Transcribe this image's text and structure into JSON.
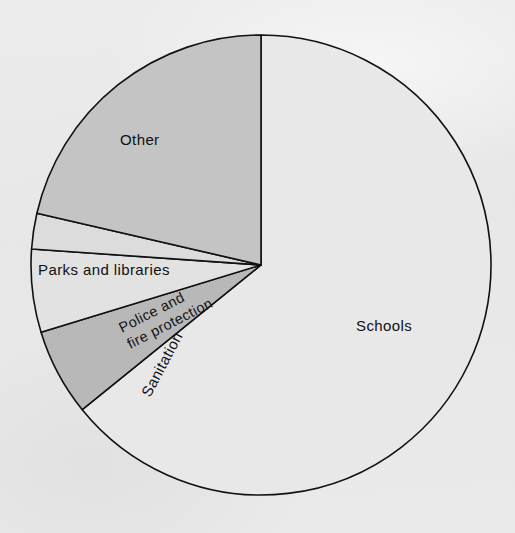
{
  "figure": {
    "background_color": "#e9e9e9",
    "outline_color": "#111111"
  },
  "chart_data": {
    "type": "pie",
    "title": "",
    "subtitle": "",
    "xlabel": "",
    "ylabel": "",
    "legend_position": "none",
    "grid": false,
    "labels_placement": "inside-slice",
    "start_angle_deg": 0,
    "direction": "clockwise",
    "categories": [
      "Schools",
      "Sanitation",
      "Police and fire protection",
      "Parks and libraries",
      "Other"
    ],
    "values": [
      64.2,
      6.1,
      5.8,
      2.5,
      21.4
    ],
    "units": "percent",
    "slices": [
      {
        "label": "Schools",
        "label_line_1": "Schools",
        "label_line_2": "",
        "value": 64.2,
        "start_angle_deg": 0,
        "end_angle_deg": 231,
        "color": "#e8e8e8",
        "label_rotation_deg": 0,
        "label_x": 356,
        "label_y": 331
      },
      {
        "label": "Sanitation",
        "label_line_1": "Sanitation",
        "label_line_2": "",
        "value": 6.1,
        "start_angle_deg": 231,
        "end_angle_deg": 253,
        "color": "#b8b8b8",
        "label_rotation_deg": -62,
        "label_x": 150,
        "label_y": 398
      },
      {
        "label": "Police and fire protection",
        "label_line_1": "Police and",
        "label_line_2": "fire protection",
        "value": 5.8,
        "start_angle_deg": 253,
        "end_angle_deg": 274,
        "color": "#e2e2e2",
        "label_rotation_deg": -27,
        "label_x": 122,
        "label_y": 333
      },
      {
        "label": "Parks and libraries",
        "label_line_1": "Parks and libraries",
        "label_line_2": "",
        "value": 2.5,
        "start_angle_deg": 274,
        "end_angle_deg": 283,
        "color": "#dcdcdc",
        "label_rotation_deg": 0,
        "label_x": 38,
        "label_y": 275
      },
      {
        "label": "Other",
        "label_line_1": "Other",
        "label_line_2": "",
        "value": 21.4,
        "start_angle_deg": 283,
        "end_angle_deg": 360,
        "color": "#c4c4c4",
        "label_rotation_deg": 0,
        "label_x": 120,
        "label_y": 145
      }
    ],
    "geometry": {
      "center_x": 261,
      "center_y": 265,
      "radius": 230
    }
  }
}
